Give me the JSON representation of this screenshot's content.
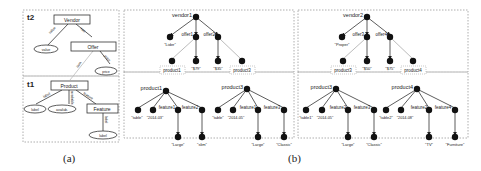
{
  "schema_panel": {
    "caption": "(a)",
    "t2": {
      "label": "t2",
      "vendor": "Vendor",
      "offer": "Offer",
      "value": "value",
      "price": "price",
      "edges": {
        "vendor_value": "value",
        "vendor_offer": "has",
        "offer_price": "price",
        "offer_product": "item"
      }
    },
    "t1": {
      "label": "t1",
      "product": "Product",
      "label_node": "label",
      "available": "availab.",
      "feature": "Feature",
      "feature_label": "label",
      "edges": {
        "product_label": "label",
        "product_available": "available",
        "product_feature": "feature",
        "feature_label": "label"
      }
    }
  },
  "instance_panel": {
    "caption": "(b)",
    "left": {
      "vendor": "vendor1",
      "vendor_value": "\"Lider\"",
      "offers": [
        "offer1",
        "offer2"
      ],
      "prices": [
        "\"$79\"",
        "\"$35\""
      ],
      "products": [
        "product1",
        "product3"
      ],
      "product1": {
        "name": "product1",
        "label": "\"table\"",
        "date": "\"2014-03\"",
        "features": [
          "feature1",
          "feature2"
        ],
        "feature_labels": [
          "\"Large\"",
          "\"slim\""
        ]
      },
      "product3": {
        "name": "product3",
        "label": "\"table\"",
        "date": "\"2014-05\"",
        "features": [
          "feature1",
          "feature3"
        ],
        "feature_labels": [
          "\"Large\"",
          "\"Classic\""
        ]
      }
    },
    "right": {
      "vendor": "vendor2",
      "vendor_value": "\"Proper\"",
      "offers": [
        "offer3",
        "offer4"
      ],
      "prices": [
        "\"$50\"",
        "\"$75\""
      ],
      "products": [
        "product3",
        "product4"
      ],
      "product3": {
        "name": "product3",
        "label": "\"table1\"",
        "date": "\"2014-05\"",
        "features": [
          "feature2",
          "feature3"
        ],
        "feature_labels": [
          "\"Large\"",
          "\"Classic\""
        ]
      },
      "product4": {
        "name": "product4",
        "label": "\"table2\"",
        "date": "\"2014-08\"",
        "features": [
          "feature2",
          "feature4"
        ],
        "feature_labels": [
          "\"TV\"",
          "\"Furniture\""
        ]
      }
    }
  }
}
